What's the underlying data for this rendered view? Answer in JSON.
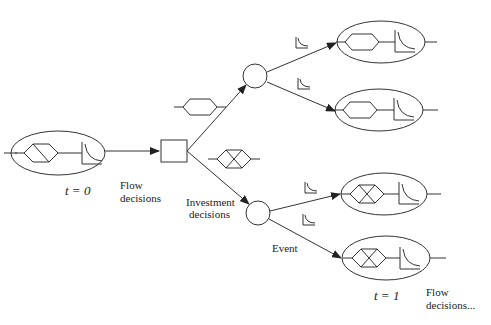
{
  "diagram": {
    "type": "decision-tree",
    "colors": {
      "line": "#333333",
      "text": "#222222",
      "background": "#ffffff"
    },
    "labels": {
      "t0": "t = 0",
      "t1": "t = 1",
      "flow_decisions": [
        "Flow",
        "decisions"
      ],
      "investment_decisions": [
        "Investment",
        "decisions"
      ],
      "event": "Event",
      "flow_decisions_next": [
        "Flow",
        "decisions..."
      ]
    },
    "nodes": [
      {
        "id": "state-t0",
        "kind": "state-ellipse",
        "icons": [
          "hexagon-slashed-icon",
          "decay-curve-icon"
        ],
        "label": "t = 0"
      },
      {
        "id": "decision-square",
        "kind": "decision-node"
      },
      {
        "id": "chance-top",
        "kind": "chance-node"
      },
      {
        "id": "chance-bottom",
        "kind": "chance-node"
      },
      {
        "id": "state-t1-a",
        "kind": "state-ellipse",
        "icons": [
          "hexagon-icon",
          "decay-curve-icon"
        ]
      },
      {
        "id": "state-t1-b",
        "kind": "state-ellipse",
        "icons": [
          "hexagon-icon",
          "decay-curve-icon"
        ]
      },
      {
        "id": "state-t1-c",
        "kind": "state-ellipse",
        "icons": [
          "hexagon-crossed-icon",
          "decay-curve-icon"
        ]
      },
      {
        "id": "state-t1-d",
        "kind": "state-ellipse",
        "icons": [
          "hexagon-crossed-icon",
          "decay-curve-icon"
        ]
      }
    ],
    "edge_annotations": [
      {
        "edge": "decision-square -> chance-top",
        "icon": "hexagon-icon"
      },
      {
        "edge": "decision-square -> chance-bottom",
        "icon": "hexagon-crossed-icon"
      },
      {
        "edge": "chance-top -> state-t1-a",
        "icon": "decay-curve-icon"
      },
      {
        "edge": "chance-top -> state-t1-b",
        "icon": "decay-curve-icon"
      },
      {
        "edge": "chance-bottom -> state-t1-c",
        "icon": "decay-curve-icon"
      },
      {
        "edge": "chance-bottom -> state-t1-d",
        "icon": "decay-curve-icon"
      }
    ]
  }
}
